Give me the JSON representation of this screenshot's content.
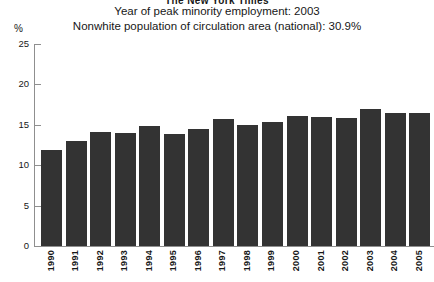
{
  "header": {
    "masthead": "The New York Times",
    "subtitle_1": "Year of peak minority employment: 2003",
    "subtitle_2": "Nonwhite population of circulation area (national): 30.9%"
  },
  "axis": {
    "unit_label": "%"
  },
  "colors": {
    "bar": "#333333",
    "axis": "#8f8f8f",
    "text": "#171717",
    "background": "#ffffff"
  },
  "chart_data": {
    "type": "bar",
    "title": "The New York Times",
    "subtitle": "Year of peak minority employment: 2003",
    "annotation": "Nonwhite population of circulation area (national): 30.9%",
    "xlabel": "",
    "ylabel": "%",
    "ylim": [
      0,
      25
    ],
    "yticks": [
      0,
      5,
      10,
      15,
      20,
      25
    ],
    "ytick_labels": [
      "0",
      "5",
      "10",
      "15",
      "20",
      "25"
    ],
    "grid": false,
    "legend": false,
    "categories": [
      "1990",
      "1991",
      "1992",
      "1993",
      "1994",
      "1995",
      "1996",
      "1997",
      "1998",
      "1999",
      "2000",
      "2001",
      "2002",
      "2003",
      "2004",
      "2005"
    ],
    "values": [
      11.9,
      13.0,
      14.1,
      14.0,
      14.9,
      13.9,
      14.5,
      15.7,
      15.0,
      15.4,
      16.1,
      16.0,
      15.9,
      16.9,
      16.5,
      16.5
    ]
  }
}
